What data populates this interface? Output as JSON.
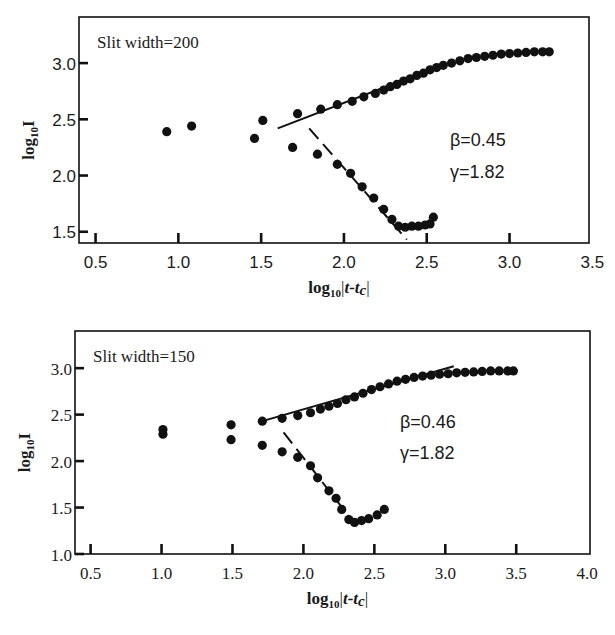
{
  "figure": {
    "background": "#ffffff",
    "ink": "#111111"
  },
  "chart_data": [
    {
      "type": "scatter",
      "panel": "top",
      "title": "",
      "annotation_label": "Slit width=200",
      "xlabel": "log10|t-tc|",
      "ylabel": "log10 I",
      "xlim": [
        0.4,
        3.48
      ],
      "ylim": [
        1.4,
        3.41
      ],
      "xticks": [
        0.5,
        1.0,
        1.5,
        2.0,
        2.5,
        3.0,
        3.5
      ],
      "xtick_marks": [
        0.5,
        1.0,
        1.5,
        2.0,
        2.5,
        3.0
      ],
      "xtick_labels": [
        "0.5",
        "1.0",
        "1.5",
        "2.0",
        "2.5",
        "3.0",
        "3.5"
      ],
      "yticks": [
        1.5,
        2.0,
        2.5,
        3.0
      ],
      "ytick_labels": [
        "1.5",
        "2.0",
        "2.5",
        "3.0"
      ],
      "grid": false,
      "tick_font": "sans",
      "exponents": [
        {
          "label": "β=0.45",
          "x": 2.64,
          "y": 2.26
        },
        {
          "label": "γ=1.82",
          "x": 2.64,
          "y": 1.98
        }
      ],
      "series": [
        {
          "name": "early scattered points",
          "points": [
            [
              0.93,
              2.39
            ],
            [
              1.08,
              2.44
            ],
            [
              1.46,
              2.33
            ],
            [
              1.51,
              2.49
            ]
          ]
        },
        {
          "name": "upper branch (order parameter)",
          "points": [
            [
              1.72,
              2.55
            ],
            [
              1.86,
              2.59
            ],
            [
              1.96,
              2.63
            ],
            [
              2.05,
              2.66
            ],
            [
              2.12,
              2.7
            ],
            [
              2.19,
              2.73
            ],
            [
              2.24,
              2.76
            ],
            [
              2.28,
              2.79
            ],
            [
              2.32,
              2.81
            ],
            [
              2.36,
              2.84
            ],
            [
              2.4,
              2.86
            ],
            [
              2.44,
              2.89
            ],
            [
              2.48,
              2.91
            ],
            [
              2.52,
              2.94
            ],
            [
              2.56,
              2.96
            ],
            [
              2.6,
              2.98
            ],
            [
              2.65,
              3.0
            ],
            [
              2.7,
              3.02
            ],
            [
              2.75,
              3.04
            ],
            [
              2.8,
              3.05
            ],
            [
              2.85,
              3.06
            ],
            [
              2.9,
              3.07
            ],
            [
              2.95,
              3.08
            ],
            [
              3.0,
              3.085
            ],
            [
              3.05,
              3.09
            ],
            [
              3.1,
              3.095
            ],
            [
              3.15,
              3.1
            ],
            [
              3.2,
              3.1
            ],
            [
              3.24,
              3.1
            ]
          ]
        },
        {
          "name": "lower branch (susceptibility)",
          "points": [
            [
              1.69,
              2.25
            ],
            [
              1.84,
              2.19
            ],
            [
              1.96,
              2.1
            ],
            [
              2.04,
              2.02
            ],
            [
              2.11,
              1.9
            ],
            [
              2.18,
              1.8
            ],
            [
              2.24,
              1.7
            ],
            [
              2.29,
              1.61
            ],
            [
              2.33,
              1.55
            ],
            [
              2.37,
              1.54
            ],
            [
              2.41,
              1.55
            ],
            [
              2.45,
              1.55
            ],
            [
              2.49,
              1.56
            ],
            [
              2.52,
              1.57
            ],
            [
              2.54,
              1.63
            ]
          ]
        }
      ],
      "fit_lines": [
        {
          "name": "beta fit (solid)",
          "style": "solid",
          "from": [
            1.6,
            2.42
          ],
          "to": [
            2.5,
            2.93
          ]
        },
        {
          "name": "gamma fit (dashed)",
          "style": "dashed",
          "from": [
            1.79,
            2.42
          ],
          "to": [
            2.38,
            1.43
          ]
        }
      ]
    },
    {
      "type": "scatter",
      "panel": "bottom",
      "title": "",
      "annotation_label": "Slit width=150",
      "xlabel": "log10|t-tc|",
      "ylabel": "log10 I",
      "xlim": [
        0.39,
        4.02
      ],
      "ylim": [
        1.0,
        3.4
      ],
      "xticks": [
        0.5,
        1.0,
        1.5,
        2.0,
        2.5,
        3.0,
        3.5,
        4.0
      ],
      "xtick_marks": [
        0.5,
        1.0,
        1.5,
        2.0,
        2.5,
        3.0,
        3.5
      ],
      "xtick_labels": [
        "0.5",
        "1.0",
        "1.5",
        "2.0",
        "2.5",
        "3.0",
        "3.5",
        "4.0"
      ],
      "yticks": [
        1.0,
        1.5,
        2.0,
        2.5,
        3.0
      ],
      "ytick_labels": [
        "1.0",
        "1.5",
        "2.0",
        "2.5",
        "3.0"
      ],
      "grid": false,
      "tick_font": "serif",
      "exponents": [
        {
          "label": "β=0.46",
          "x": 2.68,
          "y": 2.36
        },
        {
          "label": "γ=1.82",
          "x": 2.68,
          "y": 2.02
        }
      ],
      "series": [
        {
          "name": "early scattered points",
          "points": [
            [
              1.01,
              2.34
            ],
            [
              1.01,
              2.29
            ],
            [
              1.49,
              2.39
            ],
            [
              1.49,
              2.23
            ]
          ]
        },
        {
          "name": "upper branch (order parameter)",
          "points": [
            [
              1.71,
              2.43
            ],
            [
              1.85,
              2.46
            ],
            [
              1.96,
              2.49
            ],
            [
              2.05,
              2.52
            ],
            [
              2.12,
              2.56
            ],
            [
              2.18,
              2.59
            ],
            [
              2.24,
              2.62
            ],
            [
              2.3,
              2.66
            ],
            [
              2.36,
              2.69
            ],
            [
              2.42,
              2.73
            ],
            [
              2.48,
              2.77
            ],
            [
              2.54,
              2.8
            ],
            [
              2.6,
              2.83
            ],
            [
              2.66,
              2.86
            ],
            [
              2.72,
              2.88
            ],
            [
              2.78,
              2.9
            ],
            [
              2.84,
              2.915
            ],
            [
              2.9,
              2.925
            ],
            [
              2.96,
              2.935
            ],
            [
              3.02,
              2.94
            ],
            [
              3.08,
              2.95
            ],
            [
              3.14,
              2.955
            ],
            [
              3.2,
              2.96
            ],
            [
              3.26,
              2.965
            ],
            [
              3.32,
              2.97
            ],
            [
              3.38,
              2.97
            ],
            [
              3.44,
              2.97
            ],
            [
              3.48,
              2.97
            ]
          ]
        },
        {
          "name": "lower branch (susceptibility)",
          "points": [
            [
              1.71,
              2.17
            ],
            [
              1.85,
              2.1
            ],
            [
              1.96,
              2.04
            ],
            [
              2.05,
              1.95
            ],
            [
              2.1,
              1.82
            ],
            [
              2.18,
              1.68
            ],
            [
              2.23,
              1.6
            ],
            [
              2.27,
              1.48
            ],
            [
              2.32,
              1.37
            ],
            [
              2.36,
              1.34
            ],
            [
              2.41,
              1.36
            ],
            [
              2.46,
              1.38
            ],
            [
              2.52,
              1.42
            ],
            [
              2.57,
              1.48
            ]
          ]
        }
      ],
      "fit_lines": [
        {
          "name": "beta fit (solid)",
          "style": "solid",
          "from": [
            1.71,
            2.43
          ],
          "to": [
            3.06,
            3.02
          ]
        },
        {
          "name": "gamma fit (dashed)",
          "style": "dashed",
          "from": [
            1.86,
            2.31
          ],
          "to": [
            2.39,
            1.27
          ]
        }
      ]
    }
  ],
  "layout": {
    "panels": [
      {
        "left": 79,
        "top": 17,
        "right": 589,
        "bottom": 243
      },
      {
        "left": 75,
        "top": 331,
        "right": 590,
        "bottom": 554
      }
    ]
  }
}
